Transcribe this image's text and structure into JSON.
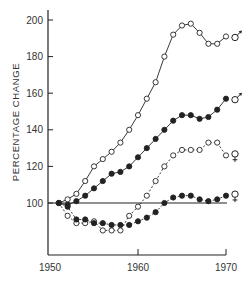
{
  "chart_data": {
    "type": "line",
    "title": "",
    "xlabel": "",
    "ylabel": "PERCENTAGE CHANGE",
    "xlim": [
      1950,
      1971
    ],
    "ylim": [
      70,
      205
    ],
    "x_ticks": [
      1950,
      1960,
      1970
    ],
    "y_ticks": [
      100,
      120,
      140,
      160,
      180,
      200
    ],
    "grid": false,
    "reference_line": {
      "y": 100,
      "from": 1951,
      "to": 1970
    },
    "legend": "inline symbols at line ends (♂ male, ♀ female)",
    "x": [
      1951,
      1952,
      1953,
      1954,
      1955,
      1956,
      1957,
      1958,
      1959,
      1960,
      1961,
      1962,
      1963,
      1964,
      1965,
      1966,
      1967,
      1968,
      1969,
      1970
    ],
    "series": [
      {
        "name": "Male (open circles)",
        "symbol": "♂",
        "marker": "open",
        "line": "solid",
        "values": [
          100,
          102,
          105,
          112,
          120,
          124,
          128,
          133,
          140,
          148,
          157,
          166,
          180,
          192,
          197,
          198,
          193,
          187,
          187,
          191
        ]
      },
      {
        "name": "Male (filled circles)",
        "symbol": "♂",
        "marker": "filled",
        "line": "solid",
        "values": [
          100,
          99,
          101,
          104,
          108,
          112,
          116,
          117,
          120,
          125,
          130,
          135,
          140,
          145,
          148,
          148,
          146,
          147,
          151,
          157
        ]
      },
      {
        "name": "Female (open circles)",
        "symbol": "♀",
        "marker": "open",
        "line": "dashed",
        "values": [
          100,
          93,
          89,
          89,
          90,
          85,
          85,
          85,
          93,
          98,
          104,
          112,
          120,
          126,
          129,
          129,
          129,
          133,
          133,
          126
        ]
      },
      {
        "name": "Female (filled circles)",
        "symbol": "♀",
        "marker": "filled",
        "line": "dashed",
        "values": [
          100,
          98,
          91,
          91,
          89,
          89,
          88,
          88,
          88,
          90,
          92,
          95,
          100,
          103,
          104,
          104,
          102,
          101,
          102,
          104
        ]
      }
    ]
  },
  "symbols": {
    "male": "♂",
    "female": "♀"
  },
  "colors": {
    "ink": "#222222",
    "background": "#ffffff"
  }
}
